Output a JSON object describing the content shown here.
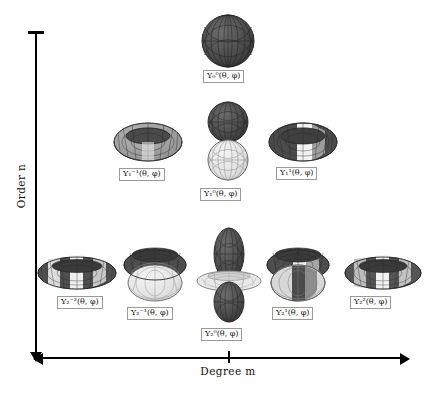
{
  "figure": {
    "type": "spherical-harmonics-grid",
    "x_axis": {
      "label": "Degree m",
      "arrows": "both",
      "tick_at_center": true
    },
    "y_axis": {
      "label": "Order n",
      "arrow": "down",
      "cap": "bar-top"
    },
    "colors": {
      "surface_dark": "#4a4a4a",
      "surface_mid": "#a0a0a0",
      "surface_light": "#e6e6e6",
      "mesh_line": "#2b2b2b",
      "label_border": "#9a9a9a",
      "axis": "#000000",
      "background": "#ffffff"
    }
  },
  "harmonics": [
    {
      "id": "Y00",
      "Y": "Y",
      "order": "0",
      "degree": "0",
      "args": "(θ, φ)",
      "row": 0,
      "col": 0,
      "shape": "sphere",
      "label_text": "Y₀⁰(θ, φ)"
    },
    {
      "id": "Y1m1",
      "Y": "Y",
      "order": "1",
      "degree": "-1",
      "args": "(θ, φ)",
      "row": 1,
      "col": -1,
      "shape": "torus-dark",
      "label_text": "Y₁⁻¹(θ, φ)"
    },
    {
      "id": "Y10",
      "Y": "Y",
      "order": "1",
      "degree": "0",
      "args": "(θ, φ)",
      "row": 1,
      "col": 0,
      "shape": "dumbbell",
      "label_text": "Y₁⁰(θ, φ)"
    },
    {
      "id": "Y11",
      "Y": "Y",
      "order": "1",
      "degree": "1",
      "args": "(θ, φ)",
      "row": 1,
      "col": 1,
      "shape": "torus-split",
      "label_text": "Y₁¹(θ, φ)"
    },
    {
      "id": "Y2m2",
      "Y": "Y",
      "order": "2",
      "degree": "-2",
      "args": "(θ, φ)",
      "row": 2,
      "col": -2,
      "shape": "flat-torus",
      "label_text": "Y₂⁻²(θ, φ)"
    },
    {
      "id": "Y2m1",
      "Y": "Y",
      "order": "2",
      "degree": "-1",
      "args": "(θ, φ)",
      "row": 2,
      "col": -1,
      "shape": "double-torus",
      "label_text": "Y₂⁻¹(θ, φ)"
    },
    {
      "id": "Y20",
      "Y": "Y",
      "order": "2",
      "degree": "0",
      "args": "(θ, φ)",
      "row": 2,
      "col": 0,
      "shape": "dumbbell-ring",
      "label_text": "Y₂⁰(θ, φ)"
    },
    {
      "id": "Y21",
      "Y": "Y",
      "order": "2",
      "degree": "1",
      "args": "(θ, φ)",
      "row": 2,
      "col": 1,
      "shape": "double-torus",
      "label_text": "Y₂¹(θ, φ)"
    },
    {
      "id": "Y22",
      "Y": "Y",
      "order": "2",
      "degree": "2",
      "args": "(θ, φ)",
      "row": 2,
      "col": 2,
      "shape": "flat-torus",
      "label_text": "Y₂²(θ, φ)"
    }
  ]
}
